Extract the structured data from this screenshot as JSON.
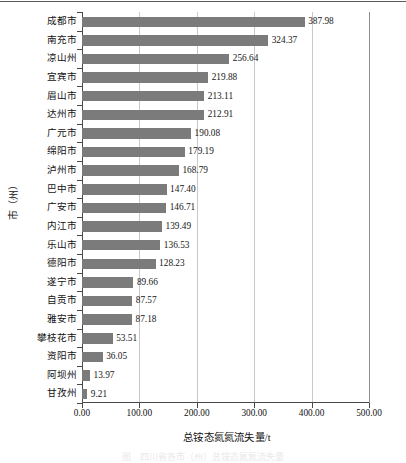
{
  "figure": {
    "has_top_rule": true,
    "bar_color": "#7b7b7b",
    "gridline_color": "#c9c9c9",
    "axis_color": "#4a4a4a"
  },
  "axes": {
    "y_title": "市（州）",
    "x_title": "总铵态氮氮流失量/t",
    "x_ticklabels": [
      "0.00",
      "100.00",
      "200.00",
      "300.00",
      "400.00",
      "500.00"
    ]
  },
  "chart_data": {
    "type": "bar",
    "orientation": "horizontal",
    "title": "",
    "subtitle": "",
    "xlabel": "总铵态氮氮流失量/t",
    "ylabel": "市（州）",
    "xlim": [
      0,
      500
    ],
    "xticks": [
      0,
      100,
      200,
      300,
      400,
      500
    ],
    "grid": "vertical",
    "legend": "none",
    "categories": [
      "成都市",
      "南充市",
      "凉山州",
      "宜宾市",
      "眉山市",
      "达州市",
      "广元市",
      "绵阳市",
      "泸州市",
      "巴中市",
      "广安市",
      "内江市",
      "乐山市",
      "德阳市",
      "遂宁市",
      "自贡市",
      "雅安市",
      "攀枝花市",
      "资阳市",
      "阿坝州",
      "甘孜州"
    ],
    "values": [
      387.98,
      324.37,
      256.64,
      219.88,
      213.11,
      212.91,
      190.08,
      179.19,
      168.79,
      147.4,
      146.71,
      139.49,
      136.53,
      128.23,
      89.66,
      87.57,
      87.18,
      53.51,
      36.05,
      13.97,
      9.21
    ],
    "value_labels": [
      "387.98",
      "324.37",
      "256.64",
      "219.88",
      "213.11",
      "212.91",
      "190.08",
      "179.19",
      "168.79",
      "147.40",
      "146.71",
      "139.49",
      "136.53",
      "128.23",
      "89.66",
      "87.57",
      "87.18",
      "53.51",
      "36.05",
      "13.97",
      "9.21"
    ]
  },
  "caption": "图　四川省各市（州）总铵态氮氮流失量"
}
